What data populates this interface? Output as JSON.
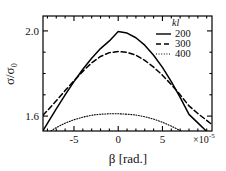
{
  "chart_data": {
    "type": "line",
    "title": "",
    "xlabel": "β [rad.]",
    "ylabel": "σ/σ₀",
    "x_multiplier": "×10",
    "x_multiplier_exp": "-5",
    "xlim": [
      -8.5,
      10.6
    ],
    "ylim": [
      1.53,
      2.07
    ],
    "xticks": [
      -5,
      0,
      5
    ],
    "xticklabels": [
      "-5",
      "0",
      "5"
    ],
    "yticks": [
      1.6,
      2.0
    ],
    "yticklabels": [
      "1.6",
      "2.0"
    ],
    "y_minor_step": 0.1,
    "grid": false,
    "legend_position": "upper-right",
    "legend_title": "kl",
    "series": [
      {
        "name": "200",
        "style": "solid",
        "x": [
          -8.5,
          -8.0,
          -7.0,
          -6.0,
          -5.0,
          -4.0,
          -3.0,
          -2.0,
          -1.0,
          0.0,
          1.0,
          2.0,
          3.0,
          4.0,
          5.0,
          6.0,
          7.0,
          8.0,
          9.0,
          10.0,
          10.6
        ],
        "y": [
          1.532,
          1.566,
          1.634,
          1.7,
          1.762,
          1.82,
          1.872,
          1.917,
          1.953,
          1.997,
          1.99,
          1.968,
          1.933,
          1.886,
          1.829,
          1.762,
          1.688,
          1.608,
          1.568,
          1.528,
          1.522
        ]
      },
      {
        "name": "300",
        "style": "dashed",
        "x": [
          -8.5,
          -8.0,
          -7.0,
          -6.0,
          -5.0,
          -4.0,
          -3.0,
          -2.0,
          -1.0,
          0.0,
          1.0,
          2.0,
          3.0,
          4.0,
          5.0,
          6.0,
          7.0,
          8.0,
          9.0,
          10.0,
          10.6
        ],
        "y": [
          1.604,
          1.626,
          1.672,
          1.72,
          1.766,
          1.81,
          1.85,
          1.88,
          1.898,
          1.903,
          1.899,
          1.886,
          1.862,
          1.83,
          1.792,
          1.748,
          1.7,
          1.648,
          1.612,
          1.58,
          1.56
        ]
      },
      {
        "name": "400",
        "style": "dotted",
        "x": [
          -8.5,
          -8.2,
          -7.5,
          -7.0,
          -6.0,
          -5.0,
          -4.0,
          -3.0,
          -2.0,
          -1.0,
          0.0,
          1.0,
          2.0,
          3.0,
          4.0,
          5.0,
          6.0,
          7.0,
          8.0,
          8.6
        ],
        "y": [
          1.498,
          1.51,
          1.533,
          1.546,
          1.567,
          1.583,
          1.595,
          1.604,
          1.609,
          1.611,
          1.611,
          1.609,
          1.605,
          1.597,
          1.586,
          1.571,
          1.553,
          1.532,
          1.508,
          1.494
        ]
      }
    ]
  },
  "legend": {
    "title": "kl",
    "entries": [
      {
        "label": "200",
        "style": "solid"
      },
      {
        "label": "300",
        "style": "dashed"
      },
      {
        "label": "400",
        "style": "dotted"
      }
    ]
  },
  "axes": {
    "y_label": "σ/σ₀",
    "x_label": "β [rad.]",
    "x_exponent_base": "×10",
    "x_exponent_sup": "-5",
    "xtick_labels": [
      "-5",
      "0",
      "5"
    ],
    "ytick_labels": [
      "2.0",
      "1.6"
    ]
  },
  "colors": {
    "line": "#000000",
    "axis": "#000000",
    "background": "#ffffff"
  }
}
